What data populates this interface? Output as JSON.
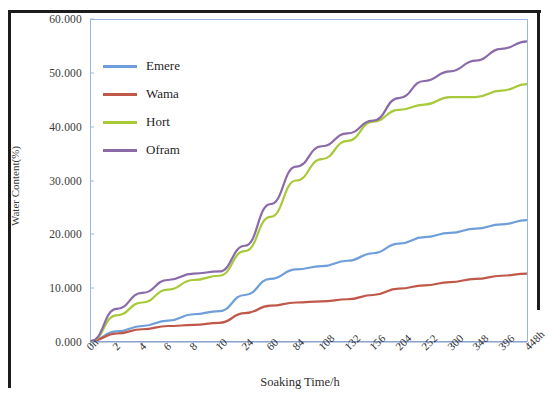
{
  "chart_data": {
    "type": "line",
    "title": "",
    "xlabel": "Soaking Time/h",
    "ylabel": "Water Content(%)",
    "categories": [
      "0h",
      "2",
      "4",
      "6",
      "8",
      "10",
      "24",
      "60",
      "84",
      "108",
      "132",
      "156",
      "204",
      "252",
      "300",
      "348",
      "396",
      "448h"
    ],
    "ylim": [
      0,
      60
    ],
    "yticks": [
      0,
      10,
      20,
      30,
      40,
      50,
      60
    ],
    "ytick_labels": [
      "0.000",
      "10.000",
      "20.000",
      "30.000",
      "40.000",
      "50.000",
      "60.000"
    ],
    "grid": false,
    "legend_position": "upper-left-inside",
    "series": [
      {
        "name": "Emere",
        "color": "#6e9fd8",
        "values": [
          0.0,
          1.8,
          2.8,
          3.8,
          5.0,
          5.6,
          8.6,
          11.6,
          13.4,
          14.0,
          15.0,
          16.4,
          18.2,
          19.4,
          20.2,
          21.0,
          21.8,
          22.6
        ]
      },
      {
        "name": "Wama",
        "color": "#c0584a",
        "values": [
          0.0,
          1.4,
          2.2,
          2.8,
          3.0,
          3.4,
          5.2,
          6.6,
          7.2,
          7.4,
          7.8,
          8.6,
          9.8,
          10.4,
          11.0,
          11.6,
          12.2,
          12.6
        ]
      },
      {
        "name": "Hort",
        "color": "#a8c93a",
        "values": [
          0.0,
          4.8,
          7.2,
          9.6,
          11.4,
          12.2,
          16.8,
          23.2,
          30.0,
          34.0,
          37.4,
          41.0,
          43.2,
          44.2,
          45.6,
          45.6,
          46.8,
          48.0
        ]
      },
      {
        "name": "Ofram",
        "color": "#8a6aa8",
        "values": [
          0.0,
          6.0,
          9.0,
          11.4,
          12.6,
          13.0,
          17.8,
          25.6,
          32.6,
          36.4,
          38.8,
          41.2,
          45.4,
          48.6,
          50.4,
          52.4,
          54.6,
          56.0
        ]
      }
    ]
  },
  "legend": {
    "items": [
      {
        "label": "Emere",
        "color": "#6e9fd8"
      },
      {
        "label": "Wama",
        "color": "#c0584a"
      },
      {
        "label": "Hort",
        "color": "#a8c93a"
      },
      {
        "label": "Ofram",
        "color": "#8a6aa8"
      }
    ]
  }
}
